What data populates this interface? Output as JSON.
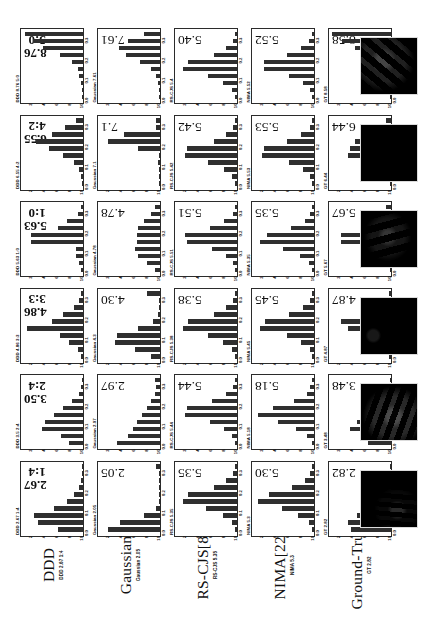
{
  "figure": {
    "orientation": "rotated-90-ccw",
    "rows": [
      {
        "name": "DDD",
        "sub_prefix": "DDD"
      },
      {
        "name": "Gaussian",
        "sub_prefix": "Gaussian"
      },
      {
        "name": "RS-CJS[8]",
        "sub_prefix": "RS-CJS"
      },
      {
        "name": "NIMA[22]",
        "sub_prefix": "NIMA"
      },
      {
        "name": "Ground-Truth",
        "sub_prefix": "GT"
      }
    ],
    "row_sub_labels": [
      "DDD 2.67 1:4",
      "Gaussian 2.05",
      "RS-CJS 5.35",
      "NIMA 5.3",
      "GT 2.82"
    ],
    "panel_titles": [
      [
        "DDD 2.67 1:4",
        "DDD 3.5  2:4",
        "DDD 4.86 3:3",
        "DDD 5.63 1:0",
        "DDD 6.55 4:2",
        "DDD 8.76 5:0"
      ],
      [
        "Gaussian 2.05",
        "Gaussian 2.97",
        "Gaussian 4.3",
        "Gaussian 4.78",
        "Gaussian 7.1",
        "Gaussian 7.61"
      ],
      [
        "RS-CJS 5.35",
        "RS-CJS 5.44",
        "RS-CJS 5.38",
        "RS-CJS 5.51",
        "RS-CJS 5.42",
        "RS-CJS 5.4"
      ],
      [
        "NIMA 5.3",
        "NIMA 5.18",
        "NIMA 5.45",
        "NIMA 5.35",
        "NIMA 5.53",
        "NIMA 5.52"
      ],
      [
        "GT 2.82",
        "GT 3.48",
        "GT 4.87",
        "GT 5.67",
        "GT 6.44",
        "GT 8.58"
      ]
    ],
    "axis": {
      "xtick_labels": [
        "0.3",
        "0.2",
        "0.1",
        "0.0"
      ],
      "xtick_values": [
        0.3,
        0.2,
        0.1,
        0.0
      ],
      "ytick_labels": [
        "2",
        "4",
        "6",
        "8",
        "10"
      ],
      "ytick_values": [
        2,
        4,
        6,
        8,
        10
      ],
      "bin_labels": [
        "1",
        "2",
        "3",
        "4",
        "5",
        "6",
        "7",
        "8",
        "9",
        "10"
      ],
      "ylim": [
        0,
        0.35
      ],
      "grid": false
    },
    "thumbnails_count": 6
  },
  "chart_data": {
    "type": "bar",
    "title": "",
    "xlabel": "score bin",
    "ylabel": "probability",
    "ylim": [
      0,
      0.35
    ],
    "categories": [
      "1",
      "2",
      "3",
      "4",
      "5",
      "6",
      "7",
      "8",
      "9",
      "10"
    ],
    "grid": false,
    "legend_position": "none",
    "panels": [
      {
        "row": "DDD",
        "column": 1,
        "mean": "2.67",
        "ratio": "1:4",
        "label": "DDD 2.67 1:4",
        "values": [
          0.14,
          0.25,
          0.27,
          0.16,
          0.09,
          0.05,
          0.02,
          0.01,
          0.0,
          0.0
        ]
      },
      {
        "row": "DDD",
        "column": 2,
        "mean": "3.50",
        "ratio": "2:4",
        "label": "DDD 3.5 2:4",
        "values": [
          0.08,
          0.12,
          0.23,
          0.21,
          0.16,
          0.11,
          0.06,
          0.02,
          0.01,
          0.0
        ]
      },
      {
        "row": "DDD",
        "column": 3,
        "mean": "4.86",
        "ratio": "3:3",
        "label": "DDD 4.86 3:3",
        "values": [
          0.01,
          0.03,
          0.08,
          0.13,
          0.31,
          0.17,
          0.11,
          0.05,
          0.02,
          0.01
        ]
      },
      {
        "row": "DDD",
        "column": 4,
        "mean": "5.63",
        "ratio": "1:0",
        "label": "DDD 5.63 1:0",
        "values": [
          0.01,
          0.02,
          0.04,
          0.04,
          0.29,
          0.29,
          0.14,
          0.09,
          0.03,
          0.01
        ]
      },
      {
        "row": "DDD",
        "column": 5,
        "mean": "6.55",
        "ratio": "4:2",
        "label": "DDD 6.55 4:2",
        "values": [
          0.0,
          0.01,
          0.02,
          0.05,
          0.11,
          0.19,
          0.26,
          0.17,
          0.1,
          0.04
        ]
      },
      {
        "row": "DDD",
        "column": 6,
        "mean": "8.76",
        "ratio": "5:0",
        "label": "DDD 8.76 5:0",
        "values": [
          0.0,
          0.0,
          0.01,
          0.02,
          0.03,
          0.06,
          0.13,
          0.22,
          0.28,
          0.32
        ]
      },
      {
        "row": "Gaussian",
        "column": 1,
        "mean": "2.05",
        "ratio": "",
        "label": "Gaussian 2.05",
        "values": [
          0.29,
          0.22,
          0.09,
          0.02,
          0.0,
          0.0,
          0.0,
          0.0,
          0.0,
          0.02
        ]
      },
      {
        "row": "Gaussian",
        "column": 2,
        "mean": "2.97",
        "ratio": "",
        "label": "Gaussian 2.97",
        "values": [
          0.24,
          0.18,
          0.15,
          0.13,
          0.1,
          0.07,
          0.05,
          0.03,
          0.02,
          0.03
        ]
      },
      {
        "row": "Gaussian",
        "column": 3,
        "mean": "4.30",
        "ratio": "",
        "label": "Gaussian 4.3",
        "values": [
          0.05,
          0.14,
          0.25,
          0.24,
          0.12,
          0.04,
          0.01,
          0.0,
          0.0,
          0.07
        ]
      },
      {
        "row": "Gaussian",
        "column": 4,
        "mean": "4.78",
        "ratio": "",
        "label": "Gaussian 4.78",
        "values": [
          0.03,
          0.07,
          0.12,
          0.14,
          0.13,
          0.13,
          0.12,
          0.09,
          0.05,
          0.03
        ]
      },
      {
        "row": "Gaussian",
        "column": 5,
        "mean": "7.1",
        "ratio": "",
        "label": "Gaussian 7.1",
        "values": [
          0.0,
          0.0,
          0.0,
          0.01,
          0.0,
          0.12,
          0.29,
          0.2,
          0.02,
          0.02
        ]
      },
      {
        "row": "Gaussian",
        "column": 6,
        "mean": "7.61",
        "ratio": "",
        "label": "Gaussian 7.61",
        "values": [
          0.0,
          0.0,
          0.01,
          0.02,
          0.05,
          0.11,
          0.19,
          0.23,
          0.18,
          0.09
        ]
      },
      {
        "row": "RS-CJS[8]",
        "column": 1,
        "mean": "5.35",
        "ratio": "",
        "label": "RS-CJS 5.35",
        "values": [
          0.01,
          0.03,
          0.08,
          0.17,
          0.3,
          0.27,
          0.13,
          0.06,
          0.02,
          0.01
        ]
      },
      {
        "row": "RS-CJS[8]",
        "column": 2,
        "mean": "5.44",
        "ratio": "",
        "label": "RS-CJS 5.44",
        "values": [
          0.01,
          0.03,
          0.07,
          0.15,
          0.29,
          0.28,
          0.14,
          0.06,
          0.02,
          0.01
        ]
      },
      {
        "row": "RS-CJS[8]",
        "column": 3,
        "mean": "5.38",
        "ratio": "",
        "label": "RS-CJS 5.38",
        "values": [
          0.01,
          0.03,
          0.08,
          0.16,
          0.3,
          0.27,
          0.13,
          0.06,
          0.02,
          0.01
        ]
      },
      {
        "row": "RS-CJS[8]",
        "column": 4,
        "mean": "5.51",
        "ratio": "",
        "label": "RS-CJS 5.51",
        "values": [
          0.01,
          0.02,
          0.06,
          0.14,
          0.28,
          0.29,
          0.15,
          0.07,
          0.02,
          0.01
        ]
      },
      {
        "row": "RS-CJS[8]",
        "column": 5,
        "mean": "5.42",
        "ratio": "",
        "label": "RS-CJS 5.42",
        "values": [
          0.01,
          0.03,
          0.07,
          0.16,
          0.29,
          0.28,
          0.13,
          0.06,
          0.02,
          0.01
        ]
      },
      {
        "row": "RS-CJS[8]",
        "column": 6,
        "mean": "5.40",
        "ratio": "",
        "label": "RS-CJS 5.4",
        "values": [
          0.01,
          0.03,
          0.08,
          0.16,
          0.3,
          0.27,
          0.13,
          0.06,
          0.02,
          0.01
        ]
      },
      {
        "row": "NIMA[22]",
        "column": 1,
        "mean": "5.30",
        "ratio": "",
        "label": "NIMA 5.3",
        "values": [
          0.01,
          0.03,
          0.09,
          0.18,
          0.31,
          0.25,
          0.12,
          0.05,
          0.02,
          0.01
        ]
      },
      {
        "row": "NIMA[22]",
        "column": 2,
        "mean": "5.18",
        "ratio": "",
        "label": "NIMA 5.18",
        "values": [
          0.01,
          0.04,
          0.1,
          0.2,
          0.31,
          0.23,
          0.11,
          0.04,
          0.02,
          0.01
        ]
      },
      {
        "row": "NIMA[22]",
        "column": 3,
        "mean": "5.45",
        "ratio": "",
        "label": "NIMA 5.45",
        "values": [
          0.01,
          0.02,
          0.07,
          0.15,
          0.3,
          0.27,
          0.14,
          0.06,
          0.02,
          0.01
        ]
      },
      {
        "row": "NIMA[22]",
        "column": 4,
        "mean": "5.35",
        "ratio": "",
        "label": "NIMA 5.35",
        "values": [
          0.01,
          0.03,
          0.08,
          0.17,
          0.3,
          0.26,
          0.13,
          0.05,
          0.02,
          0.01
        ]
      },
      {
        "row": "NIMA[22]",
        "column": 5,
        "mean": "5.53",
        "ratio": "",
        "label": "NIMA 5.53",
        "values": [
          0.01,
          0.02,
          0.06,
          0.14,
          0.29,
          0.28,
          0.15,
          0.07,
          0.02,
          0.01
        ]
      },
      {
        "row": "NIMA[22]",
        "column": 6,
        "mean": "5.52",
        "ratio": "",
        "label": "NIMA 5.52",
        "values": [
          0.01,
          0.02,
          0.06,
          0.14,
          0.28,
          0.28,
          0.15,
          0.07,
          0.03,
          0.01
        ]
      },
      {
        "row": "Ground-Truth",
        "column": 1,
        "mean": "2.82",
        "ratio": "",
        "label": "GT 2.82",
        "values": [
          0.22,
          0.24,
          0.19,
          0.13,
          0.08,
          0.05,
          0.02,
          0.01,
          0.0,
          0.0
        ]
      },
      {
        "row": "Ground-Truth",
        "column": 2,
        "mean": "3.48",
        "ratio": "",
        "label": "GT 3.48",
        "values": [
          0.13,
          0.14,
          0.23,
          0.19,
          0.14,
          0.08,
          0.04,
          0.02,
          0.01,
          0.0
        ]
      },
      {
        "row": "Ground-Truth",
        "column": 3,
        "mean": "4.87",
        "ratio": "",
        "label": "GT 4.87",
        "values": [
          0.01,
          0.06,
          0.13,
          0.1,
          0.24,
          0.28,
          0.09,
          0.04,
          0.02,
          0.01
        ]
      },
      {
        "row": "Ground-Truth",
        "column": 4,
        "mean": "5.67",
        "ratio": "",
        "label": "GT 5.67",
        "values": [
          0.0,
          0.01,
          0.04,
          0.06,
          0.28,
          0.28,
          0.12,
          0.08,
          0.04,
          0.03
        ]
      },
      {
        "row": "Ground-Truth",
        "column": 5,
        "mean": "6.44",
        "ratio": "",
        "label": "GT 6.44",
        "values": [
          0.0,
          0.01,
          0.02,
          0.05,
          0.24,
          0.23,
          0.2,
          0.14,
          0.09,
          0.03
        ]
      },
      {
        "row": "Ground-Truth",
        "column": 6,
        "mean": "8.58",
        "ratio": "",
        "label": "GT 8.58",
        "values": [
          0.0,
          0.0,
          0.01,
          0.02,
          0.0,
          0.03,
          0.12,
          0.2,
          0.27,
          0.33
        ]
      }
    ]
  }
}
